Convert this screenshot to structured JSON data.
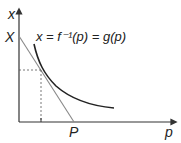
{
  "diagram": {
    "axes": {
      "y_label": "x",
      "x_label": "p"
    },
    "labels": {
      "intercept_y": "X",
      "intercept_x": "P",
      "curve_equation": "x = f⁻¹(p) = g(p)"
    },
    "colors": {
      "axis": "#333333",
      "curve": "#222222",
      "line": "#777777",
      "dashed": "#555555"
    }
  }
}
